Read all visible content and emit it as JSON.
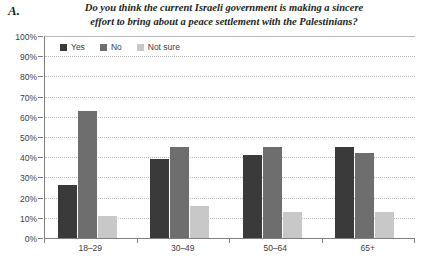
{
  "panel": {
    "label": "A."
  },
  "chart_data": {
    "type": "bar",
    "title": "Do you think the current Israeli government is making a sincere effort to bring about a peace settlement with the Palestinians?",
    "title_lines": [
      "Do you think the current Israeli government is making a sincere",
      "effort to bring about a peace settlement with the Palestinians?"
    ],
    "xlabel": "",
    "ylabel": "",
    "ylim": [
      0,
      100
    ],
    "ytick_labels": [
      "100%",
      "90%",
      "80%",
      "70%",
      "60%",
      "50%",
      "40%",
      "30%",
      "20%",
      "10%",
      "0%"
    ],
    "ytick_values": [
      100,
      90,
      80,
      70,
      60,
      50,
      40,
      30,
      20,
      10,
      0
    ],
    "grid": true,
    "legend_position": "top-left-inside",
    "categories": [
      "18–29",
      "30–49",
      "50–64",
      "65+"
    ],
    "series": [
      {
        "name": "Yes",
        "color": "#3a3a3a",
        "values": [
          26,
          39,
          41,
          45
        ]
      },
      {
        "name": "No",
        "color": "#6e6e6e",
        "values": [
          63,
          45,
          45,
          42
        ]
      },
      {
        "name": "Not sure",
        "color": "#c8c8c8",
        "values": [
          11,
          16,
          13,
          13
        ]
      }
    ]
  }
}
